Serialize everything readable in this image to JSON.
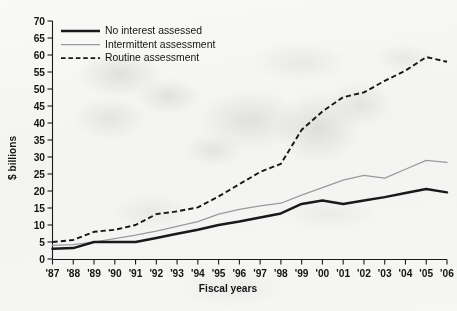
{
  "chart_data": {
    "type": "line",
    "title": "",
    "xlabel": "Fiscal years",
    "ylabel": "$ billions",
    "xlim": [
      0,
      19
    ],
    "ylim": [
      0,
      70
    ],
    "ytick_step": 5,
    "grid": false,
    "legend_position": "top-left",
    "categories": [
      "'87",
      "'88",
      "'89",
      "'90",
      "'91",
      "'92",
      "'93",
      "'94",
      "'95",
      "'96",
      "'97",
      "'98",
      "'99",
      "'00",
      "'01",
      "'02",
      "'03",
      "'04",
      "'05",
      "'06"
    ],
    "yticks": [
      0,
      5,
      10,
      15,
      20,
      25,
      30,
      35,
      40,
      45,
      50,
      55,
      60,
      65,
      70
    ],
    "series": [
      {
        "name": "No interest assessed",
        "style": "solid-thick-black",
        "color": "#19191a",
        "values": [
          3.0,
          3.2,
          5.0,
          5.0,
          5.0,
          6.2,
          7.4,
          8.6,
          10.0,
          11.0,
          12.2,
          13.4,
          16.2,
          17.2,
          16.2,
          17.2,
          18.2,
          19.4,
          20.6,
          19.6
        ]
      },
      {
        "name": "Intermittent assessment",
        "style": "solid-thin-gray",
        "color": "#9a9a9c",
        "values": [
          4.0,
          4.2,
          5.0,
          6.0,
          7.0,
          8.2,
          9.6,
          11.0,
          13.2,
          14.6,
          15.6,
          16.4,
          18.8,
          21.0,
          23.2,
          24.6,
          23.8,
          26.4,
          29.0,
          28.4
        ]
      },
      {
        "name": "Routine assessment",
        "style": "dashed-black",
        "color": "#161617",
        "values": [
          5.0,
          5.6,
          8.0,
          8.6,
          10.0,
          13.2,
          14.0,
          15.2,
          18.4,
          22.0,
          25.6,
          28.0,
          38.0,
          43.4,
          47.6,
          49.0,
          52.4,
          55.4,
          59.4,
          58.0
        ]
      }
    ]
  },
  "legend": {
    "items": [
      {
        "label": "No interest assessed"
      },
      {
        "label": "Intermittent assessment"
      },
      {
        "label": "Routine assessment"
      }
    ]
  }
}
